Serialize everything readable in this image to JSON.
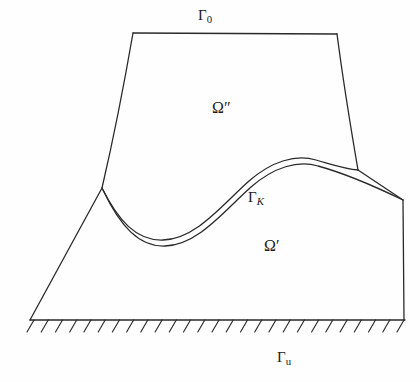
{
  "figure": {
    "name": "contact-mechanics-domain-diagram",
    "background_color": "#fefefe",
    "stroke_color": "#2a2a2a",
    "stroke_width": 1.3
  },
  "labels": {
    "gamma_0": {
      "base": "Γ",
      "sub": "0",
      "full": "Γ0",
      "x": 198,
      "y": 8
    },
    "omega_double_prime": {
      "base": "Ω",
      "mark": "″",
      "full": "Ω″",
      "x": 212,
      "y": 100
    },
    "gamma_K": {
      "base": "Γ",
      "sub": "K",
      "full": "ΓK",
      "x": 248,
      "y": 190
    },
    "omega_prime": {
      "base": "Ω",
      "mark": "′",
      "full": "Ω′",
      "x": 264,
      "y": 238
    },
    "gamma_u": {
      "base": "Γ",
      "sub": "u",
      "full": "Γu",
      "x": 277,
      "y": 350
    }
  },
  "chart_data": {
    "type": "diagram",
    "title": "",
    "viewbox": [
      0,
      0,
      420,
      382
    ],
    "paths": {
      "ground_line": "M 30 320 L 405 320",
      "ground_hatch_count": 27,
      "ground_hatch_x_start": 34,
      "ground_hatch_x_end": 404,
      "ground_hatch_dx": -7,
      "ground_hatch_dy": 12,
      "omega2_top_edge": "M 133 33 L 337 34",
      "omega2_left_edge": "M 133 33 C 124 85, 112 145, 102 188",
      "omega2_right_edge": "M 337 34 C 343 80, 352 135, 358 170",
      "omega1_left_edge": "M 102 188 L 30 320",
      "omega1_right_slope": "M 358 170 L 403 200",
      "omega1_right_edge": "M 403 200 L 404 320",
      "contact_curve_upper": "M 102 188 C 118 220, 136 241, 163 240 C 196 239, 222 205, 249 181 C 272 161, 296 154, 316 160 C 334 165, 346 169, 358 170",
      "contact_curve_lower": "M 103 190 C 120 226, 139 247, 165 246 C 198 245, 224 211, 251 187 C 274 167, 298 160, 318 166 C 340 172, 370 184, 403 200"
    },
    "key_points": {
      "omega2_top_left": [
        133,
        33
      ],
      "omega2_top_right": [
        337,
        34
      ],
      "cusp_left": [
        102,
        188
      ],
      "junction_right": [
        358,
        170
      ],
      "omega1_peak_right": [
        403,
        200
      ],
      "ground_left": [
        30,
        320
      ],
      "ground_right": [
        405,
        320
      ],
      "curve_trough": [
        163,
        240
      ],
      "curve_crest": [
        308,
        157
      ]
    }
  }
}
